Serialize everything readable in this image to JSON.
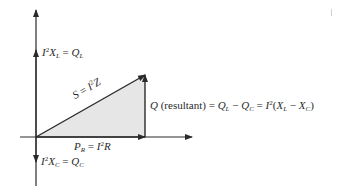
{
  "diagram": {
    "labels": {
      "reactive_inductive": "I²X_L = Q_L",
      "reactive_capacitive": "I²X_C = Q_C",
      "apparent": "S = I²Z",
      "real": "P_R = I²R",
      "resultant": "Q (resultant) = Q_L − Q_C = I²(X_L − X_C)"
    },
    "parts": {
      "ql_i": "I",
      "ql_sup": "2",
      "ql_x": "X",
      "ql_sub": "L",
      "ql_eq": " = ",
      "ql_q": "Q",
      "ql_qsub": "L",
      "qc_i": "I",
      "qc_sup": "2",
      "qc_x": "X",
      "qc_sub": "C",
      "qc_eq": " = ",
      "qc_q": "Q",
      "qc_qsub": "C",
      "s_s": "S",
      "s_eq": " = ",
      "s_i": "I",
      "s_sup": "2",
      "s_z": "Z",
      "p_p": "P",
      "p_sub": "R",
      "p_eq": " = ",
      "p_i": "I",
      "p_sup": "2",
      "p_r": "R",
      "r_q": "Q",
      "r_text": " (resultant) = ",
      "r_ql": "Q",
      "r_qlsub": "L",
      "r_minus": " − ",
      "r_qc": "Q",
      "r_qcsub": "C",
      "r_eq": " = ",
      "r_i": "I",
      "r_sup": "2",
      "r_open": "(",
      "r_xl": "X",
      "r_xlsub": "L",
      "r_minus2": " − ",
      "r_xc": "X",
      "r_xcsub": "C",
      "r_close": ")"
    },
    "colors": {
      "line": "#2a2a2a",
      "fill": "#e6e6e6"
    }
  }
}
